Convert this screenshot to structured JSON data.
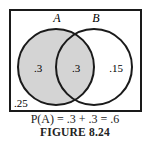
{
  "diagram": {
    "type": "venn",
    "sets": [
      {
        "label": "A",
        "shaded": true
      },
      {
        "label": "B",
        "shaded": false
      }
    ],
    "regions": {
      "a_only": ".3",
      "a_and_b": ".3",
      "b_only": ".15",
      "neither": ".25"
    },
    "colors": {
      "shade": "#d4d4d4",
      "stroke": "#1a1a1a"
    }
  },
  "formula": "P(A) = .3 + .3 = .6",
  "caption": "FIGURE 8.24"
}
